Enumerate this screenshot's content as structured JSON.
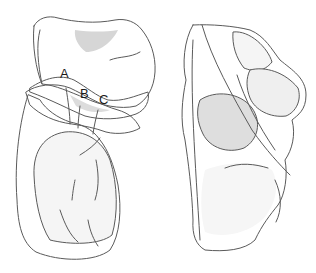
{
  "figure": {
    "type": "anatomical-illustration",
    "views": [
      {
        "id": "left-view",
        "description": "bone viewed with articular facets labeled"
      },
      {
        "id": "right-view",
        "description": "same bone, rotated view"
      }
    ],
    "labels": [
      {
        "id": "A",
        "text": "A",
        "x": 60,
        "y": 78
      },
      {
        "id": "B",
        "text": "B",
        "x": 80,
        "y": 98
      },
      {
        "id": "C",
        "text": "C",
        "x": 99,
        "y": 104
      }
    ],
    "colors": {
      "background": "#ffffff",
      "bone_light": "#f4f4f4",
      "bone_mid": "#e2e2e2",
      "bone_shadow": "#cfcfcf",
      "outline": "#5a5a5a"
    }
  }
}
